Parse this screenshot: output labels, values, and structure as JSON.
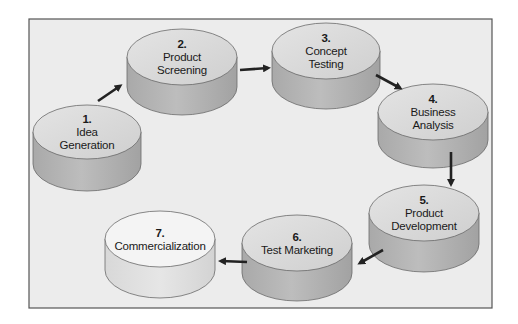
{
  "diagram": {
    "frame": {
      "x": 29,
      "y": 19,
      "w": 463,
      "h": 289,
      "fill": "#ececec",
      "stroke": "#555555"
    },
    "colors": {
      "cylinder_top": "#d8d8d8",
      "cylinder_side": "#b4b4b4",
      "final_top": "#f4f4f4",
      "final_side": "#e0e0e0",
      "arrow": "#222222"
    },
    "stages": [
      {
        "number": "1.",
        "lines": [
          "Idea",
          "Generation"
        ],
        "cx": 87,
        "cy": 132,
        "rx": 54,
        "ry": 27,
        "depth": 32
      },
      {
        "number": "2.",
        "lines": [
          "Product",
          "Screening"
        ],
        "cx": 182,
        "cy": 57,
        "rx": 55,
        "ry": 28,
        "depth": 30
      },
      {
        "number": "3.",
        "lines": [
          "Concept",
          "Testing"
        ],
        "cx": 326,
        "cy": 51,
        "rx": 54,
        "ry": 28,
        "depth": 30
      },
      {
        "number": "4.",
        "lines": [
          "Business",
          "Analysis"
        ],
        "cx": 433,
        "cy": 112,
        "rx": 55,
        "ry": 28,
        "depth": 28
      },
      {
        "number": "5.",
        "lines": [
          "Product",
          "Development"
        ],
        "cx": 424,
        "cy": 213,
        "rx": 55,
        "ry": 28,
        "depth": 31
      },
      {
        "number": "6.",
        "lines": [
          "Test Marketing"
        ],
        "cx": 297,
        "cy": 243,
        "rx": 55,
        "ry": 28,
        "depth": 30
      },
      {
        "number": "7.",
        "lines": [
          "Commercialization"
        ],
        "cx": 160,
        "cy": 239,
        "rx": 55,
        "ry": 28,
        "depth": 31
      }
    ],
    "arrows": [
      {
        "from": "1",
        "to": "2",
        "x1": 98,
        "y1": 101,
        "x2": 120,
        "y2": 86
      },
      {
        "from": "2",
        "to": "3",
        "x1": 240,
        "y1": 70,
        "x2": 268,
        "y2": 68
      },
      {
        "from": "3",
        "to": "4",
        "x1": 376,
        "y1": 75,
        "x2": 400,
        "y2": 88
      },
      {
        "from": "4",
        "to": "5",
        "x1": 451,
        "y1": 152,
        "x2": 451,
        "y2": 184
      },
      {
        "from": "5",
        "to": "6",
        "x1": 383,
        "y1": 250,
        "x2": 360,
        "y2": 263
      },
      {
        "from": "6",
        "to": "7",
        "x1": 247,
        "y1": 262,
        "x2": 221,
        "y2": 261
      }
    ]
  }
}
